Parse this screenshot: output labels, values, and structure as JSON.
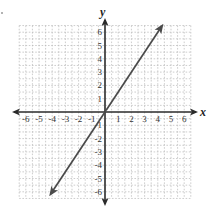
{
  "chart_data": {
    "type": "line",
    "title": "",
    "xlabel": "x",
    "ylabel": "y",
    "xlim": [
      -6,
      6
    ],
    "ylim": [
      -6,
      6
    ],
    "grid": true,
    "x_ticks": [
      -6,
      -5,
      -4,
      -3,
      -2,
      -1,
      1,
      2,
      3,
      4,
      5,
      6
    ],
    "y_ticks": [
      6,
      5,
      4,
      3,
      2,
      1,
      -1,
      -2,
      -3,
      -4,
      -5,
      -6
    ],
    "x_tick_labels": [
      "-6",
      "-5",
      "-4",
      "-3",
      "-2",
      "-1",
      "1",
      "2",
      "3",
      "4",
      "5",
      "6"
    ],
    "y_tick_labels": [
      "6",
      "5",
      "4",
      "3",
      "2",
      "1",
      "-1",
      "-2",
      "-3",
      "-4",
      "-5",
      "-6"
    ],
    "series": [
      {
        "name": "line through origin",
        "equation": "y = 1.5x",
        "slope": 1.5,
        "intercept": 0,
        "arrows": "both ends",
        "x": [
          -4.1,
          -4,
          0,
          4,
          4.3
        ],
        "y": [
          -6.15,
          -6,
          0,
          6,
          6.45
        ]
      }
    ],
    "colors": {
      "line": "#4a4a4a",
      "axes": "#2a2a2a",
      "grid": "#b8b8b8"
    }
  }
}
